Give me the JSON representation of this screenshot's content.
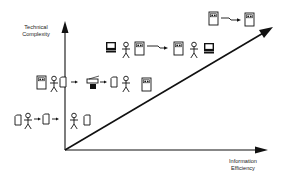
{
  "diagram": {
    "type": "evolution-diagram",
    "axes": {
      "y_axis": {
        "label_line1": "Technical",
        "label_line2": "Complexity"
      },
      "x_axis": {
        "label_line1": "Information",
        "label_line2": "Efficiency"
      }
    },
    "trend_arrow": {
      "from": "origin",
      "to": "upper-right"
    },
    "stages": [
      {
        "level": 1,
        "flow": [
          "document-icon",
          "person-icon",
          "arrow",
          "document-icon",
          "arrow",
          "person-icon",
          "document-icon"
        ]
      },
      {
        "level": 2,
        "flow": [
          "file-cabinet-icon",
          "person-icon",
          "document-icon",
          "arrow",
          "fax-machine-icon",
          "arrow",
          "document-icon",
          "person-icon",
          "file-cabinet-icon"
        ]
      },
      {
        "level": 3,
        "flow": [
          "computer-icon",
          "person-icon",
          "server-icon",
          "network-link-arrow",
          "server-icon",
          "person-icon",
          "computer-icon"
        ]
      },
      {
        "level": 4,
        "flow": [
          "server-icon",
          "network-link-arrow",
          "server-icon"
        ]
      }
    ],
    "colors": {
      "line": "#111111",
      "background": "#ffffff"
    }
  }
}
